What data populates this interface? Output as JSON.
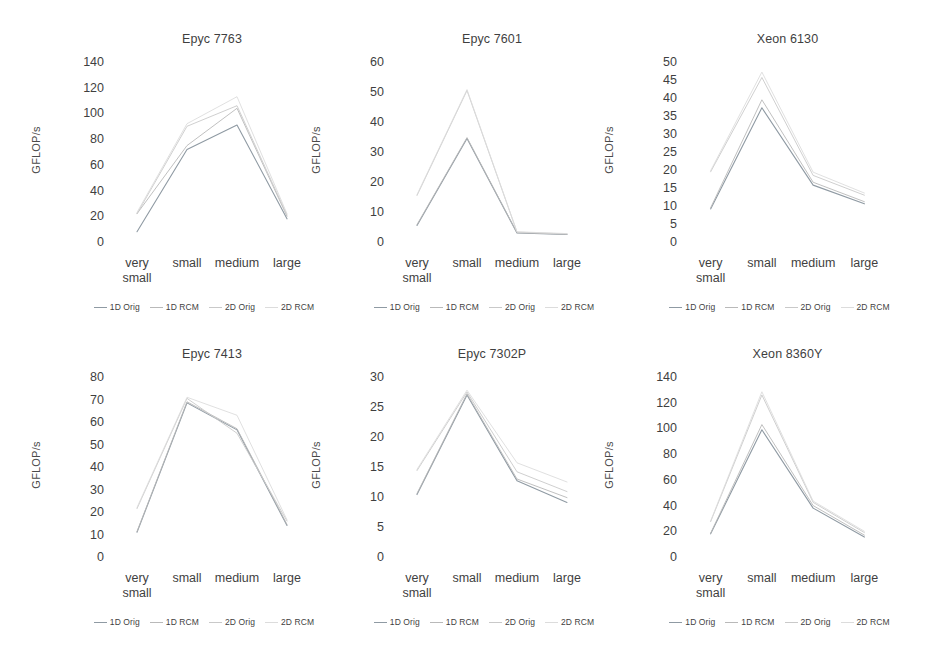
{
  "figure": {
    "series_names": [
      "1D Orig",
      "1D RCM",
      "2D Orig",
      "2D RCM"
    ],
    "series_colors": [
      "#8f9aa3",
      "#b9b9b9",
      "#c9c9c9",
      "#dcdcdc"
    ],
    "categories": [
      "very\nsmall",
      "small",
      "medium",
      "large"
    ],
    "ylabel": "GFLOP/s"
  },
  "charts": [
    {
      "id": "epyc-7763",
      "title": "Epyc 7763",
      "ylabel": "GFLOP/s",
      "ticks": [
        "140",
        "120",
        "100",
        "80",
        "60",
        "40",
        "20",
        "0"
      ],
      "ymin": 0,
      "ymax": 140,
      "chart_data": {
        "type": "line",
        "title": "Epyc 7763",
        "xlabel": "",
        "ylabel": "GFLOP/s",
        "ylim": [
          0,
          140
        ],
        "grid": false,
        "legend_position": "bottom",
        "categories": [
          "very small",
          "small",
          "medium",
          "large"
        ],
        "series": [
          {
            "name": "1D Orig",
            "values": [
              8,
              72,
              91,
              18
            ]
          },
          {
            "name": "1D RCM",
            "values": [
              22,
              75,
              104,
              20
            ]
          },
          {
            "name": "2D Orig",
            "values": [
              22,
              90,
              106,
              21
            ]
          },
          {
            "name": "2D RCM",
            "values": [
              23,
              92,
              113,
              22
            ]
          }
        ]
      }
    },
    {
      "id": "epyc-7601",
      "title": "Epyc 7601",
      "ylabel": "GFLOP/s",
      "ticks": [
        "60",
        "50",
        "40",
        "30",
        "20",
        "10",
        "0"
      ],
      "ymin": 0,
      "ymax": 60,
      "chart_data": {
        "type": "line",
        "title": "Epyc 7601",
        "xlabel": "",
        "ylabel": "GFLOP/s",
        "ylim": [
          0,
          60
        ],
        "grid": false,
        "legend_position": "bottom",
        "categories": [
          "very small",
          "small",
          "medium",
          "large"
        ],
        "series": [
          {
            "name": "1D Orig",
            "values": [
              5.5,
              34.5,
              3.0,
              2.5
            ]
          },
          {
            "name": "1D RCM",
            "values": [
              5.8,
              34.8,
              3.1,
              2.6
            ]
          },
          {
            "name": "2D Orig",
            "values": [
              15.5,
              50.5,
              3.3,
              2.7
            ]
          },
          {
            "name": "2D RCM",
            "values": [
              15.8,
              50.8,
              3.4,
              2.8
            ]
          }
        ]
      }
    },
    {
      "id": "xeon-6130",
      "title": "Xeon 6130",
      "ylabel": "GFLOP/s",
      "ticks": [
        "50",
        "45",
        "40",
        "35",
        "30",
        "25",
        "20",
        "15",
        "10",
        "5",
        "0"
      ],
      "ymin": 0,
      "ymax": 50,
      "chart_data": {
        "type": "line",
        "title": "Xeon 6130",
        "xlabel": "",
        "ylabel": "GFLOP/s",
        "ylim": [
          0,
          50
        ],
        "grid": false,
        "legend_position": "bottom",
        "categories": [
          "very small",
          "small",
          "medium",
          "large"
        ],
        "series": [
          {
            "name": "1D Orig",
            "values": [
              9.2,
              37.3,
              15.8,
              10.6
            ]
          },
          {
            "name": "1D RCM",
            "values": [
              9.5,
              39.5,
              16.6,
              11.2
            ]
          },
          {
            "name": "2D Orig",
            "values": [
              19.5,
              45.7,
              18.5,
              13.0
            ]
          },
          {
            "name": "2D RCM",
            "values": [
              19.8,
              47.2,
              19.4,
              13.6
            ]
          }
        ]
      }
    },
    {
      "id": "epyc-7413",
      "title": "Epyc 7413",
      "ylabel": "GFLOP/s",
      "ticks": [
        "80",
        "70",
        "60",
        "50",
        "40",
        "30",
        "20",
        "10",
        "0"
      ],
      "ymin": 0,
      "ymax": 80,
      "chart_data": {
        "type": "line",
        "title": "Epyc 7413",
        "xlabel": "",
        "ylabel": "GFLOP/s",
        "ylim": [
          0,
          80
        ],
        "grid": false,
        "legend_position": "bottom",
        "categories": [
          "very small",
          "small",
          "medium",
          "large"
        ],
        "series": [
          {
            "name": "1D Orig",
            "values": [
              11.0,
              68.5,
              56.5,
              14.0
            ]
          },
          {
            "name": "1D RCM",
            "values": [
              11.3,
              69.0,
              57.0,
              14.5
            ]
          },
          {
            "name": "2D Orig",
            "values": [
              21.5,
              70.5,
              55.0,
              16.0
            ]
          },
          {
            "name": "2D RCM",
            "values": [
              22.0,
              71.0,
              63.0,
              16.5
            ]
          }
        ]
      }
    },
    {
      "id": "epyc-7302p",
      "title": "Epyc 7302P",
      "ylabel": "GFLOP/s",
      "ticks": [
        "30",
        "25",
        "20",
        "15",
        "10",
        "5",
        "0"
      ],
      "ymin": 0,
      "ymax": 30,
      "chart_data": {
        "type": "line",
        "title": "Epyc 7302P",
        "xlabel": "",
        "ylabel": "GFLOP/s",
        "ylim": [
          0,
          30
        ],
        "grid": false,
        "legend_position": "bottom",
        "categories": [
          "very small",
          "small",
          "medium",
          "large"
        ],
        "series": [
          {
            "name": "1D Orig",
            "values": [
              10.4,
              27.0,
              12.7,
              9.1
            ]
          },
          {
            "name": "1D RCM",
            "values": [
              10.6,
              27.2,
              13.0,
              9.9
            ]
          },
          {
            "name": "2D Orig",
            "values": [
              14.4,
              27.5,
              14.2,
              10.9
            ]
          },
          {
            "name": "2D RCM",
            "values": [
              14.6,
              27.8,
              15.7,
              12.5
            ]
          }
        ]
      }
    },
    {
      "id": "xeon-8360y",
      "title": "Xeon 8360Y",
      "ylabel": "GFLOP/s",
      "ticks": [
        "140",
        "120",
        "100",
        "80",
        "60",
        "40",
        "20",
        "0"
      ],
      "ymin": 0,
      "ymax": 140,
      "chart_data": {
        "type": "line",
        "title": "Xeon 8360Y",
        "xlabel": "",
        "ylabel": "GFLOP/s",
        "ylim": [
          0,
          140
        ],
        "grid": false,
        "legend_position": "bottom",
        "categories": [
          "very small",
          "small",
          "medium",
          "large"
        ],
        "series": [
          {
            "name": "1D Orig",
            "values": [
              18.0,
              99.0,
              38.0,
              15.5
            ]
          },
          {
            "name": "1D RCM",
            "values": [
              18.5,
              103.0,
              40.0,
              17.0
            ]
          },
          {
            "name": "2D Orig",
            "values": [
              27.5,
              126.0,
              42.5,
              19.0
            ]
          },
          {
            "name": "2D RCM",
            "values": [
              28.0,
              128.5,
              43.5,
              20.0
            ]
          }
        ]
      }
    }
  ]
}
